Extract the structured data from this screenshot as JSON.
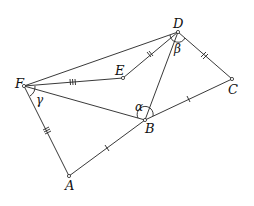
{
  "diagram": {
    "type": "geometry",
    "points": {
      "A": {
        "label": "A",
        "x": 69,
        "y": 176
      },
      "B": {
        "label": "B",
        "x": 145,
        "y": 120
      },
      "C": {
        "label": "C",
        "x": 232,
        "y": 79
      },
      "D": {
        "label": "D",
        "x": 178,
        "y": 32
      },
      "E": {
        "label": "E",
        "x": 123,
        "y": 78
      },
      "F": {
        "label": "F",
        "x": 24,
        "y": 86
      }
    },
    "segments": [
      {
        "from": "F",
        "to": "D",
        "ticks": 0
      },
      {
        "from": "F",
        "to": "E",
        "ticks": 3
      },
      {
        "from": "E",
        "to": "D",
        "ticks": 2
      },
      {
        "from": "D",
        "to": "C",
        "ticks": 2
      },
      {
        "from": "D",
        "to": "B",
        "ticks": 0
      },
      {
        "from": "F",
        "to": "B",
        "ticks": 0
      },
      {
        "from": "B",
        "to": "C",
        "ticks": 1
      },
      {
        "from": "F",
        "to": "A",
        "ticks": 3
      },
      {
        "from": "A",
        "to": "B",
        "ticks": 1
      }
    ],
    "angles": {
      "alpha": {
        "label": "α",
        "vertex": "B"
      },
      "beta": {
        "label": "β",
        "vertex": "D"
      },
      "gamma": {
        "label": "γ",
        "vertex": "F"
      }
    },
    "colors": {
      "stroke": "#222222",
      "background": "#ffffff"
    }
  }
}
